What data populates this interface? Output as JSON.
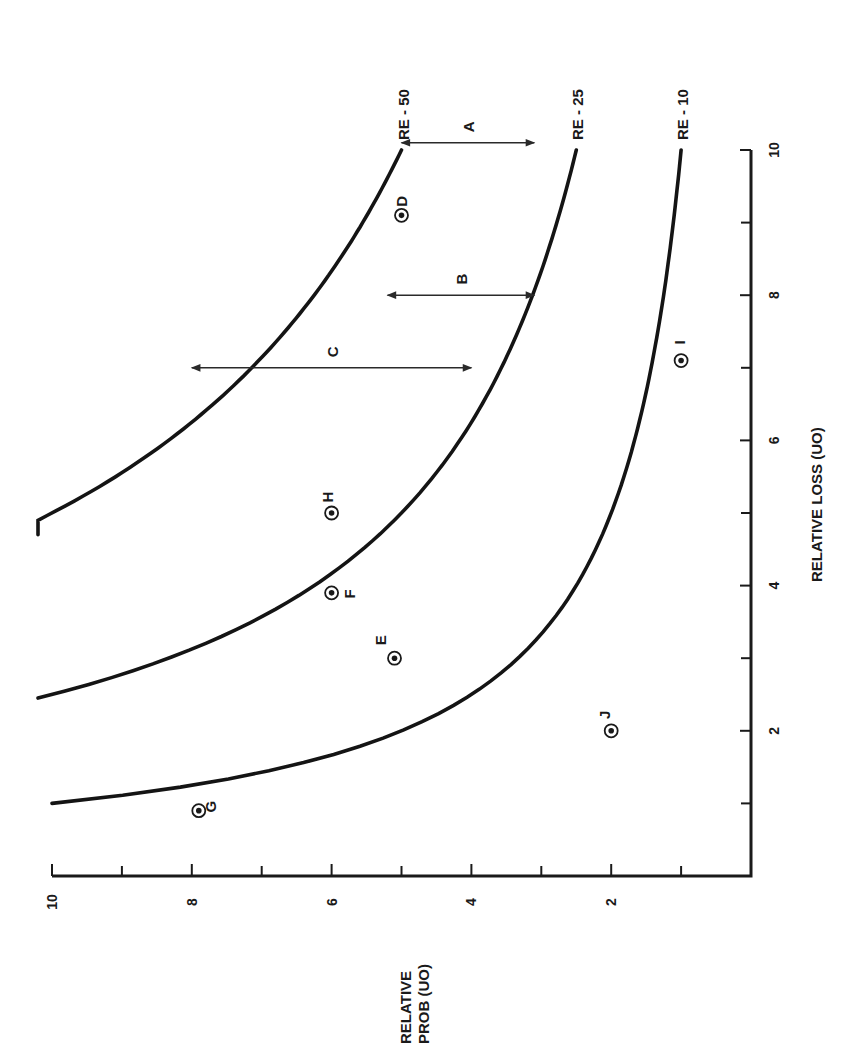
{
  "chart_data": {
    "type": "scatter",
    "orientation": "rotated 90 degrees clockwise on page",
    "title": "",
    "xlabel": "RELATIVE LOSS (UO)",
    "ylabel": "RELATIVE PROB (UO)",
    "xlim": [
      0,
      10
    ],
    "ylim": [
      0,
      10
    ],
    "x_ticks": [
      1,
      2,
      3,
      4,
      5,
      6,
      7,
      8,
      9,
      10
    ],
    "x_tick_labels": [
      "2",
      "4",
      "6",
      "8",
      "10"
    ],
    "y_ticks": [
      1,
      2,
      3,
      4,
      5,
      6,
      7,
      8,
      9,
      10
    ],
    "y_tick_labels": [
      "2",
      "4",
      "6",
      "8",
      "10"
    ],
    "grid": false,
    "curves": [
      {
        "name": "RE - 50",
        "label": "RE - 50",
        "constant": 50,
        "x_start": 4.7,
        "x_end": 10
      },
      {
        "name": "RE - 25",
        "label": "RE - 25",
        "constant": 25,
        "x_start": 2.45,
        "x_end": 10
      },
      {
        "name": "RE - 10",
        "label": "RE - 10",
        "constant": 10,
        "x_start": 1.0,
        "x_end": 10
      }
    ],
    "points": [
      {
        "label": "D",
        "x": 9.1,
        "y": 5.0
      },
      {
        "label": "I",
        "x": 7.1,
        "y": 1.0
      },
      {
        "label": "H",
        "x": 5.0,
        "y": 6.0
      },
      {
        "label": "F",
        "x": 3.9,
        "y": 6.0
      },
      {
        "label": "E",
        "x": 3.0,
        "y": 5.1
      },
      {
        "label": "J",
        "x": 2.0,
        "y": 2.0
      },
      {
        "label": "G",
        "x": 0.9,
        "y": 7.9
      }
    ],
    "annotations": [
      {
        "label": "A",
        "type": "double-arrow",
        "x": 10.1,
        "y_from": 5.0,
        "y_to": 3.1
      },
      {
        "label": "B",
        "type": "double-arrow",
        "x": 8.0,
        "y_from": 5.2,
        "y_to": 3.1
      },
      {
        "label": "C",
        "type": "double-arrow",
        "x": 7.0,
        "y_from": 8.0,
        "y_to": 4.0
      }
    ]
  }
}
